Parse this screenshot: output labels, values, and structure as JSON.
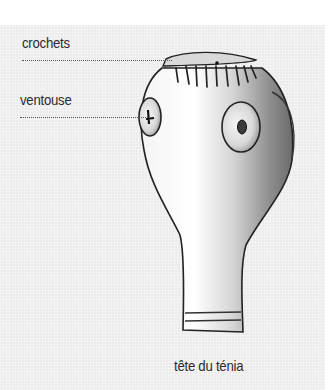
{
  "diagram": {
    "labels": [
      {
        "id": "crochets",
        "text": "crochets"
      },
      {
        "id": "ventouse",
        "text": "ventouse"
      }
    ],
    "caption": "tête du ténia"
  },
  "colors": {
    "panel_bg": "#ebebeb",
    "text": "#2b2b2b",
    "outline": "#222222",
    "shade": "#8a8a8a"
  }
}
